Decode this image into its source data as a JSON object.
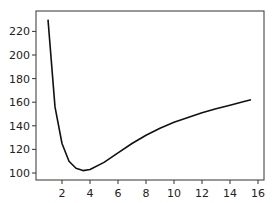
{
  "chart_data": {
    "type": "line",
    "title": "",
    "xlabel": "",
    "ylabel": "",
    "xlim": [
      0.5,
      16.2
    ],
    "ylim": [
      96,
      236
    ],
    "grid": false,
    "legend": null,
    "x_ticks": [
      2,
      4,
      6,
      8,
      10,
      12,
      14,
      16
    ],
    "y_ticks": [
      100,
      120,
      140,
      160,
      180,
      200,
      220
    ],
    "series": [
      {
        "name": "curve",
        "color": "#111111",
        "x": [
          1.0,
          1.5,
          2.0,
          2.5,
          3.0,
          3.5,
          4.0,
          5.0,
          6.0,
          7.0,
          8.0,
          9.0,
          10.0,
          11.0,
          12.0,
          13.0,
          14.0,
          15.0,
          15.5
        ],
        "y": [
          230,
          156,
          125,
          110,
          104,
          102,
          103,
          109,
          117,
          125,
          132,
          138,
          143,
          147,
          151,
          154.5,
          157.5,
          160.5,
          162
        ]
      }
    ]
  }
}
